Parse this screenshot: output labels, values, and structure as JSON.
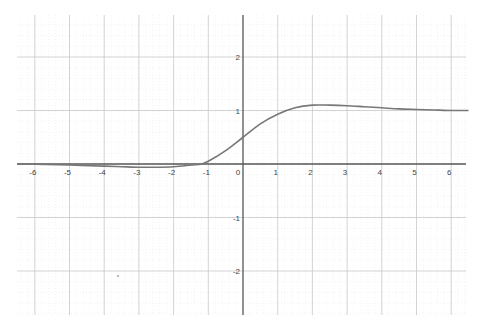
{
  "chart_data": {
    "type": "line",
    "title": "",
    "xlabel": "",
    "ylabel": "",
    "xlim": [
      -6.5,
      6.5
    ],
    "ylim": [
      -2.8,
      2.8
    ],
    "grid": true,
    "minor_grid": true,
    "legend": null,
    "x_ticks": [
      -6,
      -5,
      -4,
      -3,
      -2,
      -1,
      0,
      1,
      2,
      3,
      4,
      5,
      6
    ],
    "x_tick_labels": [
      "-6",
      "-5",
      "-4",
      "-3",
      "-2",
      "-1",
      "0",
      "1",
      "2",
      "3",
      "4",
      "5",
      "6"
    ],
    "y_ticks": [
      -2,
      -1,
      1,
      2
    ],
    "y_tick_labels": [
      "-2",
      "-1",
      "1",
      "2"
    ],
    "series": [
      {
        "name": "f(x)",
        "color": "#777777",
        "x": [
          -6.5,
          -6,
          -5,
          -4,
          -3.5,
          -3,
          -2.5,
          -2,
          -1.5,
          -1.2,
          -1,
          -0.5,
          0,
          0.5,
          1,
          1.5,
          2,
          2.5,
          3,
          3.5,
          4,
          4.5,
          5,
          5.5,
          6,
          6.5
        ],
        "y": [
          0,
          -0.005,
          -0.02,
          -0.04,
          -0.05,
          -0.06,
          -0.06,
          -0.05,
          -0.02,
          0.0,
          0.05,
          0.25,
          0.5,
          0.75,
          0.93,
          1.05,
          1.1,
          1.1,
          1.09,
          1.07,
          1.05,
          1.03,
          1.02,
          1.01,
          1.0,
          1.0
        ]
      }
    ]
  },
  "colors": {
    "axis": "#555555",
    "major_grid": "#c8c8c8",
    "minor_grid": "#e6e6e6",
    "curve": "#777777"
  }
}
